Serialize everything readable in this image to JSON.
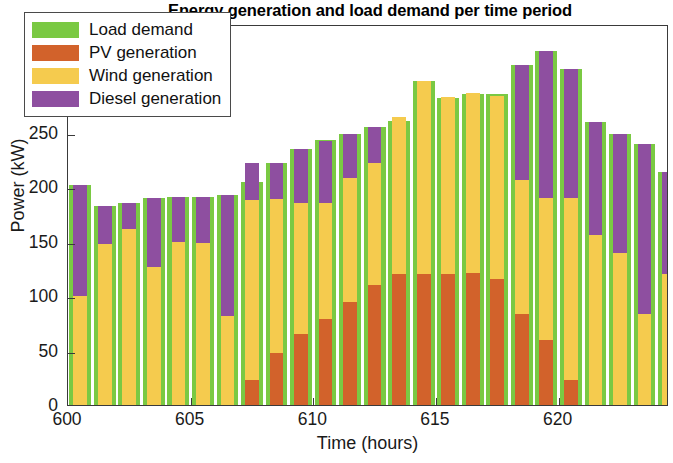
{
  "chart_data": {
    "type": "bar",
    "title": "Energy generation and load demand per time period",
    "xlabel": "Time (hours)",
    "ylabel": "Power (kW)",
    "xlim": [
      600,
      624.5
    ],
    "ylim": [
      0,
      350
    ],
    "yticks": [
      0,
      50,
      100,
      150,
      200,
      250,
      300,
      350
    ],
    "xticks": [
      600,
      605,
      610,
      615,
      620
    ],
    "grid": false,
    "legend_position": "upper-left",
    "stacked": true,
    "note": "Green 'Load demand' bars are plotted behind; PV + Wind + Diesel are stacked in a narrower bar in front.",
    "colors": {
      "load": "#7ac943",
      "pv": "#d2622b",
      "wind": "#f5cb4e",
      "diesel": "#8e4fa0",
      "axis": "#3a3a3a",
      "text": "#1a1a1a",
      "background": "#ffffff"
    },
    "legend": [
      {
        "label": "Load demand",
        "color": "#7ac943"
      },
      {
        "label": "PV generation",
        "color": "#d2622b"
      },
      {
        "label": "Wind generation",
        "color": "#f5cb4e"
      },
      {
        "label": "Diesel generation",
        "color": "#8e4fa0"
      }
    ],
    "x": [
      600,
      601,
      602,
      603,
      604,
      605,
      606,
      607,
      608,
      609,
      610,
      611,
      612,
      613,
      614,
      615,
      616,
      617,
      618,
      619,
      620,
      621,
      622,
      623,
      624
    ],
    "series": [
      {
        "name": "Load demand",
        "color": "#7ac943",
        "values": [
          202,
          183,
          186,
          190,
          191,
          191,
          193,
          205,
          222,
          235,
          243,
          249,
          255,
          261,
          298,
          282,
          286,
          286,
          312,
          325,
          309,
          260,
          249,
          240,
          214
        ]
      },
      {
        "name": "PV generation",
        "color": "#d2622b",
        "values": [
          0,
          0,
          0,
          0,
          0,
          0,
          0,
          23,
          48,
          65,
          79,
          95,
          110,
          120,
          120,
          120,
          121,
          116,
          84,
          60,
          23,
          0,
          0,
          0,
          0
        ]
      },
      {
        "name": "Wind generation",
        "color": "#f5cb4e",
        "values": [
          100,
          148,
          162,
          127,
          150,
          149,
          82,
          165,
          141,
          121,
          107,
          114,
          112,
          145,
          178,
          163,
          166,
          168,
          123,
          130,
          167,
          156,
          140,
          84,
          120
        ]
      },
      {
        "name": "Diesel generation",
        "color": "#8e4fa0",
        "values": [
          102,
          35,
          24,
          63,
          41,
          42,
          111,
          34,
          33,
          49,
          57,
          40,
          33,
          0,
          0,
          0,
          0,
          0,
          105,
          135,
          119,
          104,
          109,
          156,
          94
        ]
      }
    ],
    "stack_totals": [
      202,
      183,
      186,
      190,
      191,
      191,
      193,
      222,
      222,
      235,
      243,
      249,
      255,
      265,
      298,
      283,
      287,
      284,
      312,
      325,
      309,
      260,
      249,
      240,
      214
    ]
  }
}
